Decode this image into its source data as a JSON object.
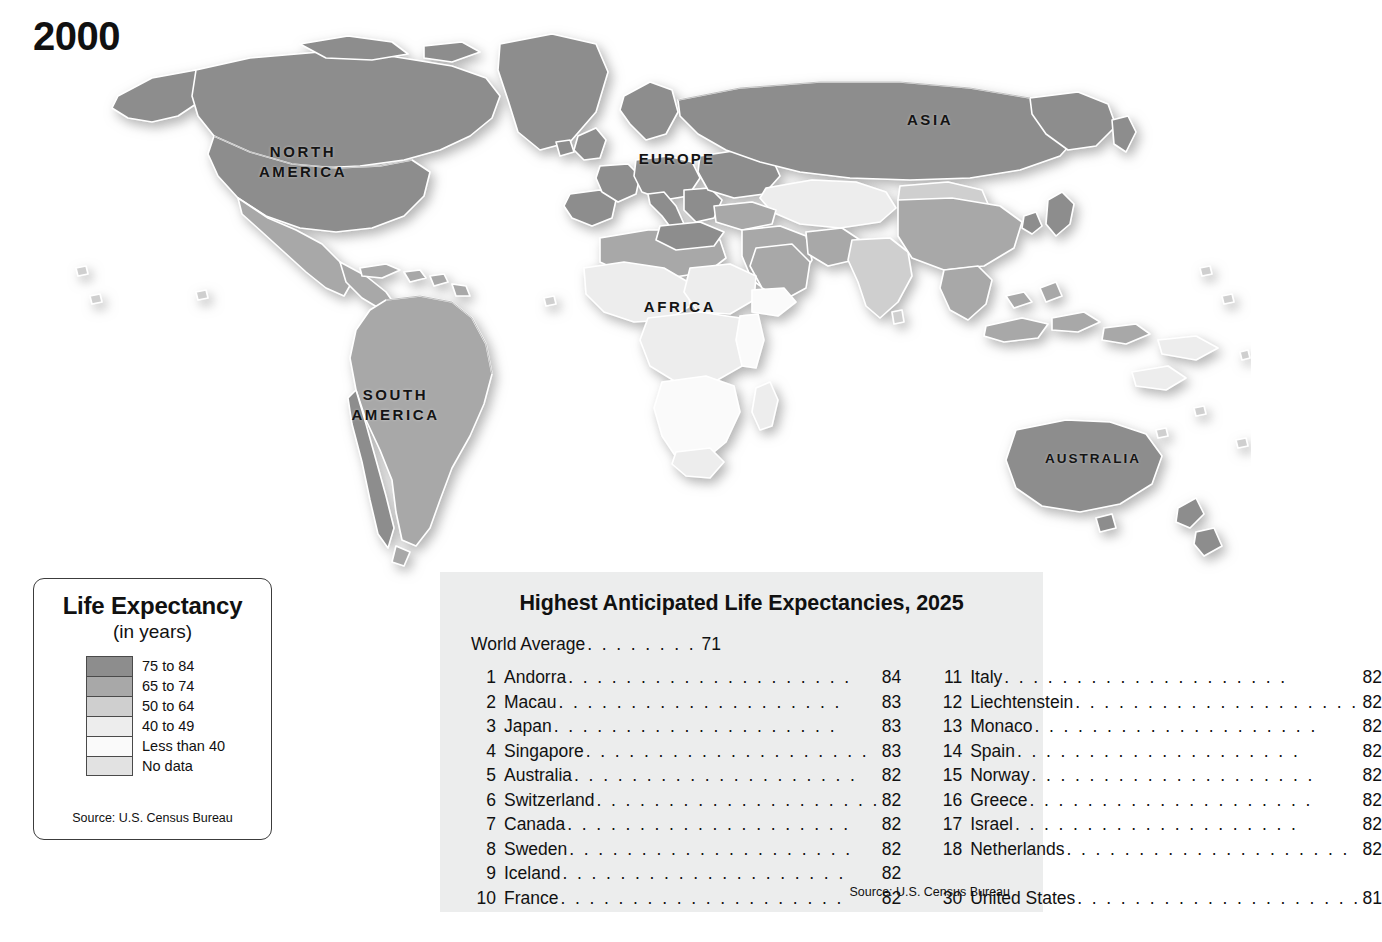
{
  "year": "2000",
  "map": {
    "continent_labels": [
      {
        "id": "north-america",
        "text": "NORTH\nAMERICA"
      },
      {
        "id": "south-america",
        "text": "SOUTH\nAMERICA"
      },
      {
        "id": "europe",
        "text": "EUROPE"
      },
      {
        "id": "africa",
        "text": "AFRICA"
      },
      {
        "id": "asia",
        "text": "ASIA"
      },
      {
        "id": "australia",
        "text": "AUSTRALIA"
      }
    ],
    "ocean_color": "#ffffff",
    "border_color": "#ffffff",
    "coast_color": "#6e6e6e"
  },
  "legend": {
    "title": "Life Expectancy",
    "subtitle": "(in years)",
    "source": "Source:  U.S. Census Bureau",
    "classes": [
      {
        "label": "75 to 84",
        "color": "#8d8d8d"
      },
      {
        "label": "65 to 74",
        "color": "#a8a8a8"
      },
      {
        "label": "50 to 64",
        "color": "#cfcfcf"
      },
      {
        "label": "40 to 49",
        "color": "#ededed"
      },
      {
        "label": "Less than 40",
        "color": "#fafafa"
      },
      {
        "label": "No data",
        "color": "#e2e2e2"
      }
    ]
  },
  "panel": {
    "title": "Highest Anticipated Life Expectancies, 2025",
    "world_average": {
      "label": "World Average",
      "value": "71"
    },
    "source": "Source:  U.S. Census Bureau",
    "left_column": [
      {
        "rank": "1",
        "country": "Andorra",
        "value": "84"
      },
      {
        "rank": "2",
        "country": "Macau",
        "value": "83"
      },
      {
        "rank": "3",
        "country": "Japan",
        "value": "83"
      },
      {
        "rank": "4",
        "country": "Singapore",
        "value": "83"
      },
      {
        "rank": "5",
        "country": "Australia",
        "value": "82"
      },
      {
        "rank": "6",
        "country": "Switzerland",
        "value": "82"
      },
      {
        "rank": "7",
        "country": "Canada",
        "value": "82"
      },
      {
        "rank": "8",
        "country": "Sweden",
        "value": "82"
      },
      {
        "rank": "9",
        "country": "Iceland",
        "value": "82"
      },
      {
        "rank": "10",
        "country": "France",
        "value": "82"
      }
    ],
    "right_column": [
      {
        "rank": "11",
        "country": "Italy",
        "value": "82"
      },
      {
        "rank": "12",
        "country": "Liechtenstein",
        "value": "82"
      },
      {
        "rank": "13",
        "country": "Monaco",
        "value": "82"
      },
      {
        "rank": "14",
        "country": "Spain",
        "value": "82"
      },
      {
        "rank": "15",
        "country": "Norway",
        "value": "82"
      },
      {
        "rank": "16",
        "country": "Greece",
        "value": "82"
      },
      {
        "rank": "17",
        "country": "Israel",
        "value": "82"
      },
      {
        "rank": "18",
        "country": "Netherlands",
        "value": "82"
      },
      {
        "rank": "",
        "country": "",
        "value": ""
      },
      {
        "rank": "30",
        "country": "United States",
        "value": "81"
      }
    ]
  }
}
